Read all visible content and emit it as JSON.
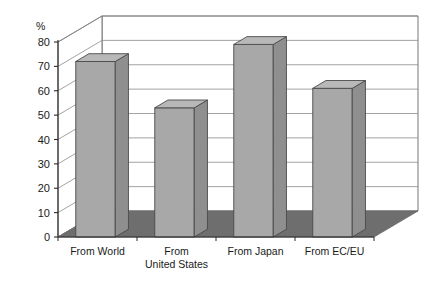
{
  "chart_data": {
    "type": "bar",
    "title": "",
    "subtitle": "",
    "xlabel": "",
    "ylabel": "%",
    "ylim": [
      0,
      80
    ],
    "ytick_step": 10,
    "yticks": [
      0,
      10,
      20,
      30,
      40,
      50,
      60,
      70,
      80
    ],
    "ytick_labels": [
      "0",
      "10",
      "20",
      "30",
      "40",
      "50",
      "60",
      "70",
      "80"
    ],
    "grid": true,
    "grid_orientation": "horizontal",
    "legend": null,
    "legend_position": "none",
    "style": "3d-column",
    "categories": [
      "From World",
      "From United States",
      "From Japan",
      "From EC/EU"
    ],
    "category_label_lines": [
      [
        "From World"
      ],
      [
        "From",
        "United States"
      ],
      [
        "From Japan"
      ],
      [
        "From EC/EU"
      ]
    ],
    "values": [
      72,
      53,
      79,
      61
    ],
    "series": [
      {
        "name": "",
        "values": [
          72,
          53,
          79,
          61
        ]
      }
    ],
    "annotations": []
  },
  "colors": {
    "bar_front": "#a8a8a8",
    "bar_top": "#b8b8b8",
    "bar_side": "#8f8f8f",
    "bar_outline": "#4a4a4a",
    "floor": "#6e6e6e",
    "wall": "#ffffff",
    "grid_line": "#8a8a8a",
    "frame_line": "#6a6a6a",
    "axis_line": "#2a2a2a",
    "text": "#1a1a1a",
    "background": "#ffffff"
  },
  "axis": {
    "unit": "%"
  }
}
